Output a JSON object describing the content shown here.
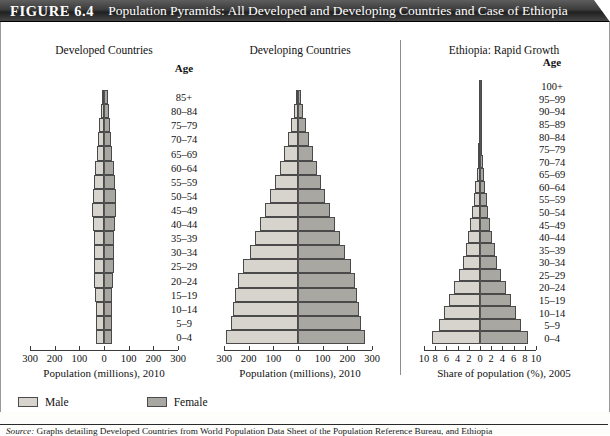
{
  "figure": {
    "label": "FIGURE 6.4",
    "title": "Population Pyramids: All Developed and Developing Countries and Case of Ethiopia"
  },
  "legend": {
    "male_label": "Male",
    "female_label": "Female",
    "male_color": "#d6d4cd",
    "female_color": "#a9a7a1"
  },
  "source": {
    "lead": "Source:",
    "text": " Graphs detailing Developed Countries from World Population Data Sheet of the Population Reference Bureau, and Ethiopia"
  },
  "age_header": "Age",
  "chart_data": [
    {
      "type": "bar",
      "id": "developed",
      "title": "Developed Countries",
      "xlabel": "Population (millions), 2010",
      "ylabel": "Age",
      "xlim": [
        -300,
        300
      ],
      "xticks": [
        -300,
        -200,
        -100,
        0,
        100,
        200,
        300
      ],
      "xticklabels": [
        "300",
        "200",
        "100",
        "0",
        "100",
        "200",
        "300"
      ],
      "grid": false,
      "legend_position": "bottom",
      "categories": [
        "0–4",
        "5–9",
        "10–14",
        "15–19",
        "20–24",
        "25–29",
        "30–34",
        "35–39",
        "40–44",
        "45–49",
        "50–54",
        "55–59",
        "60–64",
        "65–69",
        "70–74",
        "75–79",
        "80–84",
        "85+"
      ],
      "series": [
        {
          "name": "Male",
          "values": [
            34,
            34,
            34,
            36,
            39,
            41,
            41,
            42,
            44,
            48,
            46,
            41,
            37,
            29,
            23,
            19,
            14,
            9
          ]
        },
        {
          "name": "Female",
          "values": [
            32,
            32,
            33,
            34,
            38,
            40,
            40,
            42,
            44,
            48,
            47,
            43,
            40,
            32,
            27,
            24,
            20,
            16
          ]
        }
      ]
    },
    {
      "type": "bar",
      "id": "developing",
      "title": "Developing Countries",
      "xlabel": "Population (millions), 2010",
      "ylabel": "Age",
      "xlim": [
        -300,
        300
      ],
      "xticks": [
        -300,
        -200,
        -100,
        0,
        100,
        200,
        300
      ],
      "xticklabels": [
        "300",
        "200",
        "100",
        "0",
        "100",
        "200",
        "300"
      ],
      "grid": false,
      "legend_position": "bottom",
      "categories": [
        "0–4",
        "5–9",
        "10–14",
        "15–19",
        "20–24",
        "25–29",
        "30–34",
        "35–39",
        "40–44",
        "45–49",
        "50–54",
        "55–59",
        "60–64",
        "65–69",
        "70–74",
        "75–79",
        "80–84",
        "85+"
      ],
      "series": [
        {
          "name": "Male",
          "values": [
            290,
            272,
            263,
            255,
            242,
            222,
            196,
            175,
            155,
            133,
            112,
            92,
            74,
            56,
            41,
            27,
            15,
            8
          ]
        },
        {
          "name": "Female",
          "values": [
            272,
            256,
            248,
            241,
            230,
            213,
            189,
            170,
            151,
            131,
            111,
            93,
            77,
            60,
            46,
            32,
            19,
            11
          ]
        }
      ]
    },
    {
      "type": "bar",
      "id": "ethiopia",
      "title": "Ethiopia: Rapid Growth",
      "xlabel": "Share of population (%), 2005",
      "ylabel": "Age",
      "xlim": [
        -10,
        10
      ],
      "xticks": [
        -10,
        -8,
        -6,
        -4,
        -2,
        0,
        2,
        4,
        6,
        8,
        10
      ],
      "xticklabels": [
        "10",
        "8",
        "6",
        "4",
        "2",
        "0",
        "2",
        "4",
        "6",
        "8",
        "10"
      ],
      "grid": false,
      "legend_position": "bottom",
      "categories": [
        "0–4",
        "5–9",
        "10–14",
        "15–19",
        "20–24",
        "25–29",
        "30–34",
        "35–39",
        "40–44",
        "45–49",
        "50–54",
        "55–59",
        "60–64",
        "65–69",
        "70–74",
        "75–79",
        "80–84",
        "85–89",
        "90–94",
        "95–99",
        "100+"
      ],
      "series": [
        {
          "name": "Male",
          "values": [
            8.6,
            7.4,
            6.5,
            5.6,
            4.6,
            3.7,
            3.0,
            2.5,
            2.1,
            1.7,
            1.4,
            1.1,
            0.85,
            0.62,
            0.44,
            0.28,
            0.16,
            0.08,
            0.04,
            0.02,
            0.01
          ]
        },
        {
          "name": "Female",
          "values": [
            8.5,
            7.3,
            6.4,
            5.5,
            4.6,
            3.8,
            3.1,
            2.6,
            2.2,
            1.8,
            1.5,
            1.2,
            0.92,
            0.68,
            0.48,
            0.31,
            0.18,
            0.09,
            0.045,
            0.02,
            0.01
          ]
        }
      ]
    }
  ]
}
